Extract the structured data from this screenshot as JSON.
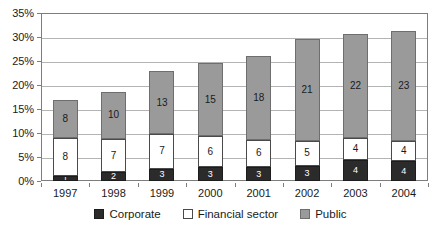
{
  "chart_data": {
    "type": "bar",
    "stacked": true,
    "title": "",
    "subtitle": "",
    "xlabel": "",
    "ylabel": "",
    "categories": [
      "1997",
      "1998",
      "1999",
      "2000",
      "2001",
      "2002",
      "2003",
      "2004"
    ],
    "series": [
      {
        "name": "Corporate",
        "color": "#2b2b2b",
        "values": [
          1,
          2,
          3,
          3,
          3,
          3,
          4,
          4
        ],
        "actual": [
          1.0,
          1.8,
          2.6,
          2.9,
          2.9,
          3.2,
          4.4,
          4.1
        ]
      },
      {
        "name": "Financial sector",
        "color": "#ffffff",
        "values": [
          8,
          7,
          7,
          6,
          6,
          5,
          4,
          4
        ],
        "actual": [
          8.0,
          7.0,
          7.1,
          6.4,
          5.7,
          5.2,
          4.5,
          4.3
        ]
      },
      {
        "name": "Public",
        "color": "#9a9a9a",
        "values": [
          8,
          10,
          13,
          15,
          18,
          21,
          22,
          23
        ],
        "actual": [
          7.8,
          9.8,
          13.2,
          15.2,
          17.5,
          21.1,
          21.7,
          22.9
        ]
      }
    ],
    "totals": [
      16.8,
      18.6,
      22.9,
      24.5,
      26.1,
      29.5,
      30.6,
      31.3
    ],
    "ylim": [
      0,
      35
    ],
    "ytick_labels": [
      "0%",
      "5%",
      "10%",
      "15%",
      "20%",
      "25%",
      "30%",
      "35%"
    ],
    "ytick_values": [
      0,
      5,
      10,
      15,
      20,
      25,
      30,
      35
    ],
    "grid": true,
    "legend_position": "bottom",
    "legend": [
      "Corporate",
      "Financial sector",
      "Public"
    ]
  },
  "legend": {
    "items": [
      {
        "label": "Corporate",
        "swatch_class": "sw-corporate"
      },
      {
        "label": "Financial sector",
        "swatch_class": "sw-financial"
      },
      {
        "label": "Public",
        "swatch_class": "sw-public"
      }
    ]
  }
}
